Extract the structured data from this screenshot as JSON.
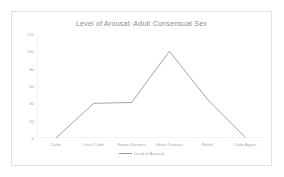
{
  "chart_data": {
    "type": "line",
    "title": "Level of Arousal:  Adult Consensual Sex",
    "xlabel": "",
    "ylabel": "",
    "categories": [
      "Calm",
      "Less Calm",
      "Some Distress",
      "Great Distress",
      "Relief",
      "Calm Again"
    ],
    "series": [
      {
        "name": "Level of Arousal",
        "values": [
          0,
          40,
          41,
          100,
          45,
          1
        ]
      }
    ],
    "yticks": [
      0,
      20,
      40,
      60,
      80,
      100,
      120
    ],
    "ylim": [
      0,
      120
    ],
    "grid": false,
    "legend_position": "bottom",
    "line_color": "#9a9a9a",
    "text_color": "#a8a8a8",
    "title_color": "#8c8c8c",
    "axis_color": "#d9d9d9",
    "border_color": "#e2e2e2",
    "background": "#ffffff"
  },
  "legend": {
    "entry_label": "Level of Arousal",
    "marker": "line-swatch"
  }
}
